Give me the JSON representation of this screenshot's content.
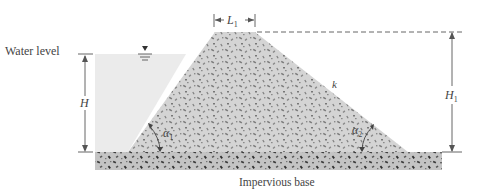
{
  "diagram": {
    "type": "earth-dam cross section",
    "labels": {
      "water_level": "Water level",
      "impervious_base": "Impervious base",
      "crest_width": "L",
      "crest_width_sub": "1",
      "water_height": "H",
      "dam_height": "H",
      "dam_height_sub": "1",
      "permeability": "k",
      "upstream_angle": "α",
      "upstream_angle_sub": "1",
      "downstream_angle": "α",
      "downstream_angle_sub": "2"
    },
    "colors": {
      "water": "#ebebeb",
      "dam_fill": "#d4d4d4",
      "base_fill": "#c2c2c2",
      "speckle": "#6e6e6e",
      "line": "#555555",
      "text": "#444444"
    }
  }
}
